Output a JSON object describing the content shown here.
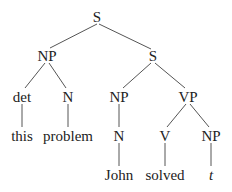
{
  "diagram": {
    "type": "syntax-tree",
    "line_color": "#555555",
    "nodes": [
      {
        "id": "s_root",
        "label": "S",
        "x": 97,
        "y": 17
      },
      {
        "id": "np_top",
        "label": "NP",
        "x": 47,
        "y": 56
      },
      {
        "id": "s_sub",
        "label": "S",
        "x": 153,
        "y": 56
      },
      {
        "id": "det",
        "label": "det",
        "x": 22,
        "y": 97
      },
      {
        "id": "n_problem",
        "label": "N",
        "x": 68,
        "y": 97
      },
      {
        "id": "np_john",
        "label": "NP",
        "x": 119,
        "y": 97
      },
      {
        "id": "vp",
        "label": "VP",
        "x": 188,
        "y": 97
      },
      {
        "id": "this",
        "label": "this",
        "x": 22,
        "y": 136
      },
      {
        "id": "problem",
        "label": "problem",
        "x": 68,
        "y": 136
      },
      {
        "id": "n_john",
        "label": "N",
        "x": 119,
        "y": 136
      },
      {
        "id": "v",
        "label": "V",
        "x": 165,
        "y": 136
      },
      {
        "id": "np_trace",
        "label": "NP",
        "x": 211,
        "y": 136
      },
      {
        "id": "john",
        "label": "John",
        "x": 119,
        "y": 175
      },
      {
        "id": "solved",
        "label": "solved",
        "x": 165,
        "y": 175
      },
      {
        "id": "trace",
        "label": "t",
        "x": 211,
        "y": 175,
        "italic": true
      }
    ],
    "edges": [
      [
        "s_root",
        "np_top"
      ],
      [
        "s_root",
        "s_sub"
      ],
      [
        "np_top",
        "det"
      ],
      [
        "np_top",
        "n_problem"
      ],
      [
        "s_sub",
        "np_john"
      ],
      [
        "s_sub",
        "vp"
      ],
      [
        "det",
        "this"
      ],
      [
        "n_problem",
        "problem"
      ],
      [
        "np_john",
        "n_john"
      ],
      [
        "n_john",
        "john"
      ],
      [
        "vp",
        "v"
      ],
      [
        "vp",
        "np_trace"
      ],
      [
        "v",
        "solved"
      ],
      [
        "np_trace",
        "trace"
      ]
    ]
  }
}
